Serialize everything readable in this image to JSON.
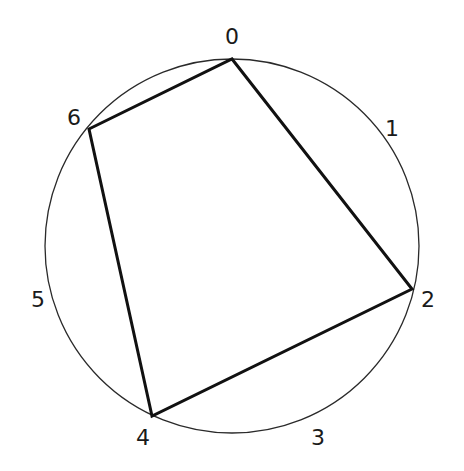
{
  "diagram": {
    "type": "heptagram",
    "schlafli": "{7/2}",
    "circle": {
      "cx": 232,
      "cy": 246,
      "r": 187,
      "stroke": "#2a2a2a"
    },
    "line_color": "#111111",
    "vertices": [
      {
        "label": "0",
        "x": 232,
        "y": 59,
        "lx": 232,
        "ly": 44,
        "anchor": "middle"
      },
      {
        "label": "1",
        "x": 376,
        "y": 129,
        "lx": 385,
        "ly": 136,
        "anchor": "start"
      },
      {
        "label": "2",
        "x": 412,
        "y": 289,
        "lx": 421,
        "ly": 307,
        "anchor": "start"
      },
      {
        "label": "3",
        "x": 311,
        "y": 416,
        "lx": 318,
        "ly": 445,
        "anchor": "middle"
      },
      {
        "label": "4",
        "x": 152,
        "y": 416,
        "lx": 143,
        "ly": 445,
        "anchor": "middle"
      },
      {
        "label": "5",
        "x": 52,
        "y": 289,
        "lx": 38,
        "ly": 307,
        "anchor": "middle"
      },
      {
        "label": "6",
        "x": 89,
        "y": 129,
        "lx": 74,
        "ly": 125,
        "anchor": "middle"
      }
    ],
    "edges": [
      [
        0,
        2
      ],
      [
        2,
        4
      ],
      [
        4,
        6
      ],
      [
        6,
        1
      ],
      [
        1,
        3
      ],
      [
        3,
        5
      ],
      [
        5,
        0
      ]
    ]
  }
}
